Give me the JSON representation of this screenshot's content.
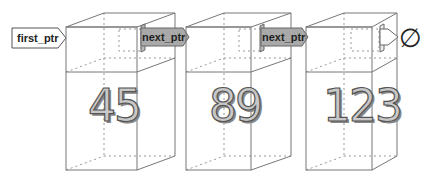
{
  "diagram": {
    "type": "linked-list",
    "head_pointer": {
      "label": "first_ptr"
    },
    "nodes": [
      {
        "value": "45",
        "pointer_label": "next_ptr",
        "points_to": "node-2"
      },
      {
        "value": "89",
        "pointer_label": "next_ptr",
        "points_to": "node-3"
      },
      {
        "value": "123",
        "pointer_label": "",
        "points_to": "null"
      }
    ],
    "null_symbol": "∅",
    "colors": {
      "edge": "#777777",
      "pointer_fill": "#a9a9a9",
      "number_fill": "#c8c8c8",
      "number_outline": "#555555",
      "background": "#ffffff"
    }
  }
}
